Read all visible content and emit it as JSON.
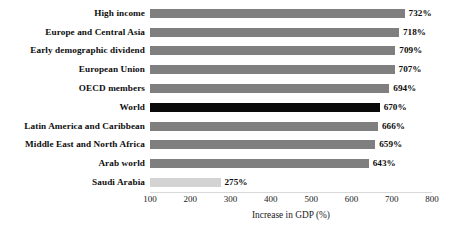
{
  "chart_data": {
    "type": "bar",
    "orientation": "horizontal",
    "title": "",
    "xlabel": "Increase in GDP (%)",
    "ylabel": "",
    "xlim": [
      100,
      800
    ],
    "xticks": [
      100,
      200,
      300,
      400,
      500,
      600,
      700,
      800
    ],
    "grid": false,
    "legend": false,
    "categories": [
      "High income",
      "Europe and Central Asia",
      "Early demographic dividend",
      "European Union",
      "OECD members",
      "World",
      "Latin America and Caribbean",
      "Middle East and North Africa",
      "Arab world",
      "Saudi Arabia"
    ],
    "values": [
      732,
      718,
      709,
      707,
      694,
      670,
      666,
      659,
      643,
      275
    ],
    "data_labels": [
      "732%",
      "718%",
      "709%",
      "707%",
      "694%",
      "670%",
      "666%",
      "659%",
      "643%",
      "275%"
    ],
    "bar_colors": [
      "#7f7f7f",
      "#7f7f7f",
      "#7f7f7f",
      "#7f7f7f",
      "#7f7f7f",
      "#0a0a0a",
      "#7f7f7f",
      "#7f7f7f",
      "#7f7f7f",
      "#d3d3d3"
    ],
    "colors": {
      "default_bar": "#7f7f7f",
      "highlight_bar": "#0a0a0a",
      "muted_bar": "#d3d3d3",
      "text": "#0d0d0d",
      "axis": "#d9d9d9",
      "background": "#ffffff"
    }
  }
}
